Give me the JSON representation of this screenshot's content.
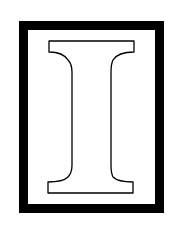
{
  "image": {
    "letter": "I",
    "description": "Outlined serif capital letter I inside a thick black rectangular border",
    "colors": {
      "background": "#ffffff",
      "border": "#000000",
      "letter_fill": "#ffffff",
      "letter_stroke": "#000000"
    }
  }
}
